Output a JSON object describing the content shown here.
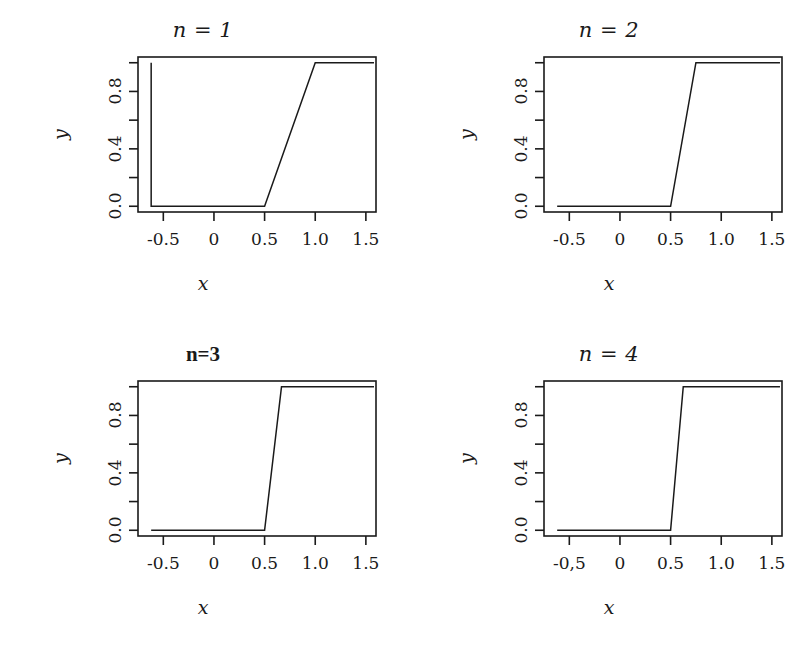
{
  "figure": {
    "background": "#ffffff",
    "ink": "#1a1a1a",
    "layout": "2x2 grid of line plots"
  },
  "chart_data": [
    {
      "type": "line",
      "title": "n = 1",
      "title_style": "italic-serif",
      "xlabel": "x",
      "ylabel": "y",
      "xlim": [
        -0.75,
        1.6
      ],
      "ylim": [
        -0.04,
        1.04
      ],
      "grid": false,
      "legend": "none",
      "x_ticks": [
        -0.5,
        0,
        0.5,
        1.0,
        1.5
      ],
      "x_ticklabels": [
        "-0.5",
        "0",
        "0.5",
        "1.0",
        "1.5"
      ],
      "y_ticks": [
        0.0,
        0.2,
        0.4,
        0.6,
        0.8,
        1.0
      ],
      "y_ticklabels": [
        "0.0",
        "",
        "0.4",
        "",
        "0.8",
        ""
      ],
      "series": [
        {
          "name": "f_1(x)",
          "x": [
            -0.62,
            -0.62,
            -0.58,
            0.5,
            1.0,
            1.58
          ],
          "y": [
            1.0,
            0.0,
            0.0,
            0.0,
            1.0,
            1.0
          ]
        }
      ],
      "transition_start": 0.5,
      "transition_end": 1.0
    },
    {
      "type": "line",
      "title": "n = 2",
      "title_style": "italic-serif",
      "xlabel": "x",
      "ylabel": "y",
      "xlim": [
        -0.75,
        1.6
      ],
      "ylim": [
        -0.04,
        1.04
      ],
      "grid": false,
      "legend": "none",
      "x_ticks": [
        -0.5,
        0,
        0.5,
        1.0,
        1.5
      ],
      "x_ticklabels": [
        "-0.5",
        "0",
        "0.5",
        "1.0",
        "1.5"
      ],
      "y_ticks": [
        0.0,
        0.2,
        0.4,
        0.6,
        0.8,
        1.0
      ],
      "y_ticklabels": [
        "0.0",
        "",
        "0.4",
        "",
        "0.8",
        ""
      ],
      "series": [
        {
          "name": "f_2(x)",
          "x": [
            -0.62,
            0.5,
            0.75,
            1.58
          ],
          "y": [
            0.0,
            0.0,
            1.0,
            1.0
          ]
        }
      ],
      "transition_start": 0.5,
      "transition_end": 0.75
    },
    {
      "type": "line",
      "title": "n=3",
      "title_style": "bold-upright",
      "xlabel": "x",
      "ylabel": "y",
      "xlim": [
        -0.75,
        1.6
      ],
      "ylim": [
        -0.04,
        1.04
      ],
      "grid": false,
      "legend": "none",
      "x_ticks": [
        -0.5,
        0,
        0.5,
        1.0,
        1.5
      ],
      "x_ticklabels": [
        "-0.5",
        "0",
        "0.5",
        "1.0",
        "1.5"
      ],
      "y_ticks": [
        0.0,
        0.2,
        0.4,
        0.6,
        0.8,
        1.0
      ],
      "y_ticklabels": [
        "0.0",
        "",
        "0.4",
        "",
        "0.8",
        ""
      ],
      "series": [
        {
          "name": "f_3(x)",
          "x": [
            -0.62,
            0.5,
            0.667,
            1.58
          ],
          "y": [
            0.0,
            0.0,
            1.0,
            1.0
          ]
        }
      ],
      "transition_start": 0.5,
      "transition_end": 0.667
    },
    {
      "type": "line",
      "title": "n = 4",
      "title_style": "italic-serif",
      "xlabel": "x",
      "ylabel": "y",
      "xlim": [
        -0.75,
        1.6
      ],
      "ylim": [
        -0.04,
        1.04
      ],
      "grid": false,
      "legend": "none",
      "x_ticks": [
        -0.5,
        0,
        0.5,
        1.0,
        1.5
      ],
      "x_ticklabels": [
        "-0,5",
        "0",
        "0.5",
        "1.0",
        "1.5"
      ],
      "y_ticks": [
        0.0,
        0.2,
        0.4,
        0.6,
        0.8,
        1.0
      ],
      "y_ticklabels": [
        "0.0",
        "",
        "0.4",
        "",
        "0.8",
        ""
      ],
      "series": [
        {
          "name": "f_4(x)",
          "x": [
            -0.62,
            0.5,
            0.625,
            1.58
          ],
          "y": [
            0.0,
            0.0,
            1.0,
            1.0
          ]
        }
      ],
      "transition_start": 0.5,
      "transition_end": 0.625
    }
  ]
}
